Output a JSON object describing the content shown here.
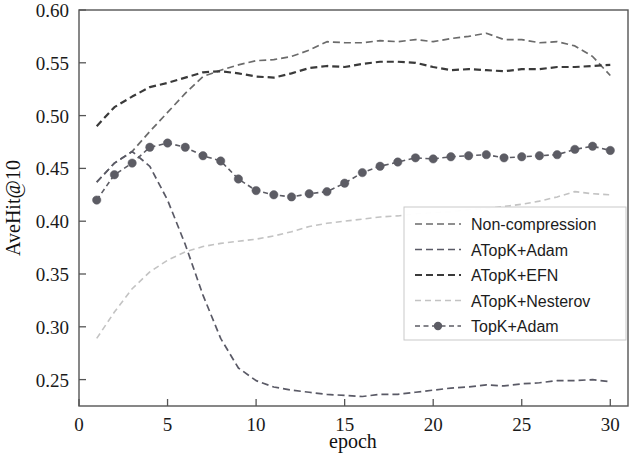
{
  "chart_data": {
    "type": "line",
    "title": "",
    "xlabel": "epoch",
    "ylabel": "AveHit@10",
    "xlim": [
      0,
      31
    ],
    "ylim": [
      0.225,
      0.6
    ],
    "xticks": [
      0,
      5,
      10,
      15,
      20,
      25,
      30
    ],
    "xtick_labels": [
      "0",
      "5",
      "10",
      "15",
      "20",
      "25",
      "30"
    ],
    "yticks": [
      0.25,
      0.3,
      0.35,
      0.4,
      0.45,
      0.5,
      0.55,
      0.6
    ],
    "ytick_labels": [
      "0.25",
      "0.30",
      "0.35",
      "0.40",
      "0.45",
      "0.50",
      "0.55",
      "0.60"
    ],
    "grid": false,
    "legend_position": "center-right",
    "x": [
      1,
      2,
      3,
      4,
      5,
      6,
      7,
      8,
      9,
      10,
      11,
      12,
      13,
      14,
      15,
      16,
      17,
      18,
      19,
      20,
      21,
      22,
      23,
      24,
      25,
      26,
      27,
      28,
      29,
      30
    ],
    "series": [
      {
        "name": "Non-compression",
        "color": "#6b6b6b",
        "style": "dashed",
        "marker": "none",
        "linewidth": 1.7,
        "dash": "7,4",
        "values": [
          0.437,
          0.455,
          0.466,
          0.485,
          0.503,
          0.521,
          0.537,
          0.543,
          0.548,
          0.552,
          0.553,
          0.556,
          0.562,
          0.57,
          0.569,
          0.569,
          0.571,
          0.57,
          0.572,
          0.57,
          0.573,
          0.575,
          0.578,
          0.572,
          0.572,
          0.569,
          0.57,
          0.566,
          0.556,
          0.538
        ]
      },
      {
        "name": "ATopK+Adam",
        "color": "#5a5a66",
        "style": "dashed",
        "marker": "none",
        "linewidth": 1.7,
        "dash": "7,4",
        "values": [
          0.437,
          0.455,
          0.466,
          0.452,
          0.42,
          0.378,
          0.33,
          0.289,
          0.261,
          0.249,
          0.243,
          0.24,
          0.238,
          0.236,
          0.235,
          0.234,
          0.236,
          0.236,
          0.238,
          0.24,
          0.242,
          0.243,
          0.245,
          0.244,
          0.246,
          0.247,
          0.249,
          0.249,
          0.25,
          0.248
        ]
      },
      {
        "name": "ATopK+EFN",
        "color": "#3a3a3a",
        "style": "dashed",
        "marker": "none",
        "linewidth": 2.2,
        "dash": "7,4",
        "values": [
          0.49,
          0.508,
          0.518,
          0.527,
          0.531,
          0.536,
          0.541,
          0.542,
          0.54,
          0.537,
          0.536,
          0.54,
          0.545,
          0.547,
          0.546,
          0.549,
          0.551,
          0.551,
          0.55,
          0.546,
          0.543,
          0.544,
          0.543,
          0.542,
          0.544,
          0.544,
          0.546,
          0.546,
          0.547,
          0.548
        ]
      },
      {
        "name": "ATopK+Nesterov",
        "color": "#c3c3c3",
        "style": "dashed",
        "marker": "none",
        "linewidth": 1.6,
        "dash": "6,4",
        "values": [
          0.289,
          0.314,
          0.336,
          0.352,
          0.363,
          0.371,
          0.376,
          0.379,
          0.381,
          0.383,
          0.386,
          0.39,
          0.395,
          0.398,
          0.4,
          0.402,
          0.404,
          0.405,
          0.407,
          0.408,
          0.409,
          0.411,
          0.412,
          0.414,
          0.416,
          0.419,
          0.423,
          0.428,
          0.426,
          0.425
        ]
      },
      {
        "name": "TopK+Adam",
        "color": "#5c5c64",
        "style": "dashed",
        "marker": "circle",
        "linewidth": 1.6,
        "dash": "5,3.5",
        "values": [
          0.42,
          0.444,
          0.455,
          0.47,
          0.474,
          0.47,
          0.462,
          0.457,
          0.44,
          0.429,
          0.425,
          0.423,
          0.426,
          0.428,
          0.436,
          0.446,
          0.452,
          0.456,
          0.46,
          0.459,
          0.461,
          0.462,
          0.463,
          0.46,
          0.461,
          0.462,
          0.463,
          0.468,
          0.471,
          0.467
        ]
      }
    ]
  },
  "legend": {
    "items": [
      {
        "label": "Non-compression"
      },
      {
        "label": "ATopK+Adam"
      },
      {
        "label": "ATopK+EFN"
      },
      {
        "label": "ATopK+Nesterov"
      },
      {
        "label": "TopK+Adam"
      }
    ]
  }
}
